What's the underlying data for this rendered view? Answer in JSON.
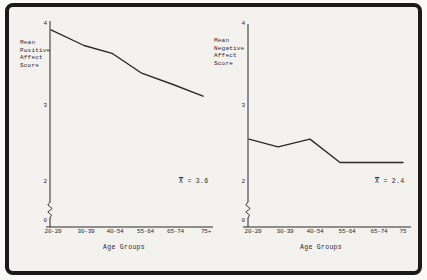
{
  "figure": {
    "paper_color": "#f3f2ee",
    "border_color": "#1a1a1a",
    "ink_color": "#2a2a2a"
  },
  "chart_data": [
    {
      "type": "line",
      "title": "",
      "ylabel": "Mean Positive Affect Score",
      "ylabel_lines": [
        "Mean",
        "Positive",
        "Affect",
        "Score"
      ],
      "xlabel": "Age Groups",
      "categories": [
        "20-29",
        "30-39",
        "40-54",
        "55-64",
        "65-74",
        "75+"
      ],
      "values": [
        3.95,
        3.75,
        3.65,
        3.4,
        3.25,
        3.1
      ],
      "yticks": [
        "4",
        "3",
        "2",
        "0"
      ],
      "ylim": [
        0,
        4
      ],
      "y_axis_break": true,
      "grid": false,
      "legend": "none",
      "annotation_symbol": "X",
      "annotation_text": " = 3.6",
      "mean": 3.6
    },
    {
      "type": "line",
      "title": "",
      "ylabel": "Mean Negative Affect Score",
      "ylabel_lines": [
        "Mean",
        "Negative",
        "Affect",
        "Score"
      ],
      "xlabel": "Age Groups",
      "categories": [
        "20-29",
        "30-39",
        "40-54",
        "55-64",
        "65-74",
        "75"
      ],
      "values": [
        2.55,
        2.45,
        2.55,
        2.25,
        2.25,
        2.25
      ],
      "yticks": [
        "4",
        "3",
        "2",
        "0"
      ],
      "ylim": [
        0,
        4
      ],
      "y_axis_break": true,
      "grid": false,
      "legend": "none",
      "annotation_symbol": "X",
      "annotation_text": " = 2.4",
      "mean": 2.4
    }
  ]
}
